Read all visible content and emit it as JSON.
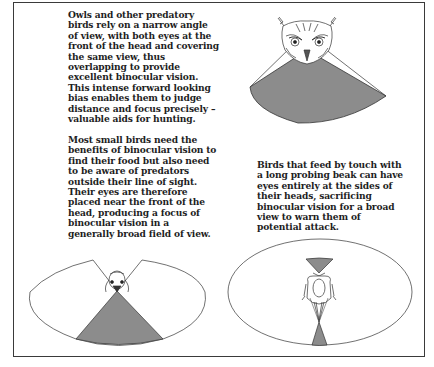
{
  "diagram": {
    "fill_color": "#8c8c8c",
    "line_color": "#333333",
    "panels": [
      {
        "id": "owl",
        "subject": "owl",
        "text": "Owls and other predatory\nbirds rely on a narrow angle\nof view, with both eyes at the\nfront of the head and covering\nthe same view, thus\noverlapping to provide\nexcellent binocular vision.\nThis intense forward looking\nbias enables them to judge\ndistance and focus precisely –\nvaluable aids for hunting.",
        "illustration": "Owl head facing viewer with a single shaded forward sector representing the narrow field of binocular vision"
      },
      {
        "id": "small-bird",
        "subject": "small bird",
        "text": "Most small birds need the\nbenefits of binocular vision to\nfind their food but also need\nto be aware of predators\noutside their line of sight.\nTheir eyes are therefore\nplaced near the front of the\nhead, producing a focus of\nbinocular vision in a\ngenerally broad field of view.",
        "illustration": "Bird head seen from above within a wide elliptical field of view, shaded binocular wedge pointing forward and narrow blind wedge behind"
      },
      {
        "id": "probing-bird",
        "subject": "long-billed probing bird",
        "text": "Birds that feed by touch with\na long probing beak can have\neyes entirely at the sides of\ntheir heads, sacrificing\nbinocular vision for a broad\nview to warn them of\npotential attack.",
        "illustration": "Long-billed bird head seen from above within a near-complete elliptical field of view, small shaded binocular zones both in front and behind"
      }
    ]
  }
}
